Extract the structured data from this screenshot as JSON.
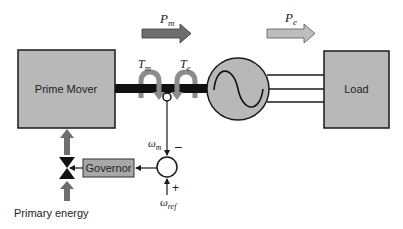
{
  "diagram": {
    "blocks": {
      "prime_mover": {
        "label": "Prime Mover"
      },
      "load": {
        "label": "Load"
      },
      "governor": {
        "label": "Governor"
      },
      "generator": {
        "label": ""
      }
    },
    "flows": {
      "mechanical_power": {
        "symbol": "P",
        "sub": "m"
      },
      "electrical_power": {
        "symbol": "P",
        "sub": "e"
      }
    },
    "torques": {
      "mechanical": {
        "symbol": "T",
        "sub": "m"
      },
      "electrical": {
        "symbol": "T",
        "sub": "e"
      }
    },
    "signals": {
      "measured_speed": {
        "symbol": "ω",
        "sub": "m",
        "sign": "−"
      },
      "reference_speed": {
        "symbol": "ω",
        "sub": "ref",
        "sign": "+"
      }
    },
    "inputs": {
      "primary_energy": {
        "label": "Primary energy"
      }
    },
    "colors": {
      "block_fill": "#b8b8b8",
      "governor_fill": "#a8a8a8",
      "pm_arrow": "#6e6e6e",
      "pe_arrow": "#bdbdbd",
      "torque_arrow": "#8c8c8c",
      "shaft": "#111111",
      "outline": "#1a1a1a"
    }
  }
}
